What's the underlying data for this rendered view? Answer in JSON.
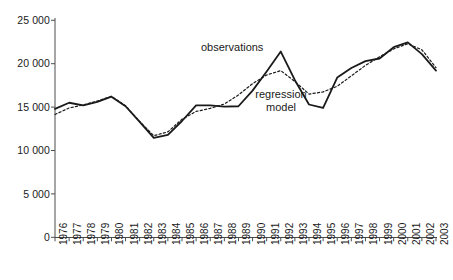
{
  "chart_data": {
    "type": "line",
    "title": "",
    "subtitle": "",
    "xlabel": "",
    "ylabel": "",
    "grid": false,
    "legend_position": "inline-annotations",
    "x": [
      1976,
      1977,
      1978,
      1979,
      1980,
      1981,
      1982,
      1983,
      1984,
      1985,
      1986,
      1987,
      1988,
      1989,
      1990,
      1991,
      1992,
      1993,
      1994,
      1995,
      1996,
      1997,
      1998,
      1999,
      2000,
      2001,
      2002,
      2003
    ],
    "xlim": [
      1976,
      2003
    ],
    "ylim": [
      0,
      25000
    ],
    "ytick_values": [
      0,
      5000,
      10000,
      15000,
      20000,
      25000
    ],
    "ytick_labels": [
      "0",
      "5 000",
      "10 000",
      "15 000",
      "20 000",
      "25 000"
    ],
    "xtick_labels": [
      "1976",
      "1977",
      "1978",
      "1979",
      "1980",
      "1981",
      "1982",
      "1983",
      "1984",
      "1985",
      "1986",
      "1987",
      "1988",
      "1989",
      "1990",
      "1991",
      "1992",
      "1993",
      "1994",
      "1995",
      "1996",
      "1997",
      "1998",
      "1999",
      "2000",
      "2001",
      "2002",
      "2003"
    ],
    "series": [
      {
        "name": "observations",
        "style": "solid",
        "color": "#1a1a1a",
        "values": [
          14800,
          15500,
          15200,
          15600,
          16200,
          15100,
          13300,
          11450,
          11800,
          13400,
          15200,
          15200,
          15050,
          15100,
          16900,
          19100,
          21400,
          18100,
          15300,
          14900,
          18400,
          19500,
          20300,
          20600,
          21900,
          22450,
          21100,
          19200
        ]
      },
      {
        "name": "regression model",
        "style": "dotted",
        "color": "#1a1a1a",
        "values": [
          14150,
          14900,
          15250,
          15700,
          16250,
          15150,
          13350,
          11700,
          12150,
          13600,
          14500,
          14850,
          15350,
          16400,
          17700,
          18700,
          19200,
          17950,
          16500,
          16750,
          17400,
          18600,
          19800,
          20800,
          21700,
          22300,
          21600,
          19550
        ]
      }
    ],
    "annotations": [
      {
        "name": "observations",
        "text": "observations",
        "x": 1991.0,
        "y": 23100
      },
      {
        "name": "regression model",
        "text_line_1": "regression",
        "text_line_2": "model",
        "x": 1992.7,
        "y": 17000
      }
    ]
  },
  "axes": {
    "y_axis_name": "value-axis",
    "x_axis_name": "year-axis"
  }
}
